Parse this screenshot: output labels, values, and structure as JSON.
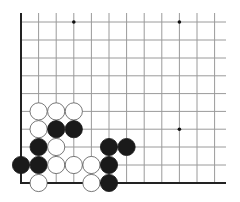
{
  "diagram": {
    "type": "go-board-fragment",
    "corner": "bottom-left",
    "grid": {
      "columns_x": [
        21,
        38.6,
        56.2,
        73.8,
        91.4,
        109,
        126.6,
        144.2,
        161.8,
        179.4,
        197,
        214.6
      ],
      "rows_y": [
        22,
        40,
        58,
        75.8,
        93.6,
        111.4,
        129.2,
        147,
        165,
        183
      ],
      "top_extend_y": 13,
      "right_extend_x": 226,
      "line_color": "#9a9a9a",
      "edge_color": "#222222"
    },
    "star_points": [
      {
        "col": 3,
        "row": 0
      },
      {
        "col": 9,
        "row": 0
      },
      {
        "col": 9,
        "row": 6
      }
    ],
    "stones": [
      {
        "color": "white",
        "col": 1,
        "row": 5
      },
      {
        "color": "white",
        "col": 2,
        "row": 5
      },
      {
        "color": "white",
        "col": 3,
        "row": 5
      },
      {
        "color": "white",
        "col": 1,
        "row": 6
      },
      {
        "color": "black",
        "col": 2,
        "row": 6
      },
      {
        "color": "black",
        "col": 3,
        "row": 6
      },
      {
        "color": "black",
        "col": 1,
        "row": 7
      },
      {
        "color": "white",
        "col": 2,
        "row": 7
      },
      {
        "color": "black",
        "col": 5,
        "row": 7
      },
      {
        "color": "black",
        "col": 6,
        "row": 7
      },
      {
        "color": "black",
        "col": 0,
        "row": 8
      },
      {
        "color": "black",
        "col": 1,
        "row": 8
      },
      {
        "color": "white",
        "col": 2,
        "row": 8
      },
      {
        "color": "white",
        "col": 3,
        "row": 8
      },
      {
        "color": "white",
        "col": 4,
        "row": 8
      },
      {
        "color": "black",
        "col": 5,
        "row": 8
      },
      {
        "color": "white",
        "col": 1,
        "row": 9
      },
      {
        "color": "white",
        "col": 4,
        "row": 9
      },
      {
        "color": "black",
        "col": 5,
        "row": 9
      }
    ],
    "stone_radius": 8.6,
    "colors": {
      "black": "#1a1a1a",
      "white": "#ffffff",
      "outline": "#555555"
    }
  }
}
